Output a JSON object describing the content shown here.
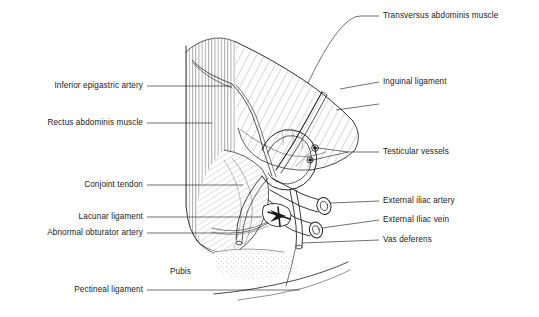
{
  "figure": {
    "background_color": "#ffffff",
    "ink_color": "#1a1a1a",
    "width": 539,
    "height": 317
  },
  "labels_left": [
    {
      "id": "inferior-epigastric-artery",
      "text": "Inferior epigastric artery",
      "x": 143,
      "y": 86,
      "leader_to_x": 232,
      "leader_to_y": 86
    },
    {
      "id": "rectus-abdominis-muscle",
      "text": "Rectus abdominis muscle",
      "x": 143,
      "y": 123,
      "leader_to_x": 212,
      "leader_to_y": 123
    },
    {
      "id": "conjoint-tendon",
      "text": "Conjoint tendon",
      "x": 143,
      "y": 185,
      "leader_to_x": 243,
      "leader_to_y": 185
    },
    {
      "id": "lacunar-ligament",
      "text": "Lacunar ligament",
      "x": 143,
      "y": 217,
      "leader_to_x": 262,
      "leader_to_y": 217
    },
    {
      "id": "abnormal-obturator-artery",
      "text": "Abnormal obturator artery",
      "x": 143,
      "y": 233,
      "leader_to_x": 268,
      "leader_to_y": 222
    },
    {
      "id": "pectineal-ligament",
      "text": "Pectineal ligament",
      "x": 143,
      "y": 290,
      "leader_to_x": 300,
      "leader_to_y": 290
    }
  ],
  "labels_right": [
    {
      "id": "transversus-abdominis-muscle",
      "text": "Transversus abdominis muscle",
      "x": 383,
      "y": 16,
      "leader_to_x": 308,
      "leader_to_y": 83
    },
    {
      "id": "inguinal-ligament",
      "text": "Inguinal ligament",
      "x": 383,
      "y": 82,
      "leader_to_x": 340,
      "leader_to_y": 89
    },
    {
      "id": "testicular-vessels",
      "text": "Testicular vessels",
      "x": 383,
      "y": 152,
      "leader_to_x": 322,
      "leader_to_y": 148
    },
    {
      "id": "external-iliac-artery",
      "text": "External iliac artery",
      "x": 383,
      "y": 201,
      "leader_to_x": 313,
      "leader_to_y": 201
    },
    {
      "id": "external-iliac-vein",
      "text": "External Iliac vein",
      "x": 383,
      "y": 220,
      "leader_to_x": 305,
      "leader_to_y": 220
    },
    {
      "id": "vas-deferens",
      "text": "Vas deferens",
      "x": 383,
      "y": 240,
      "leader_to_x": 300,
      "leader_to_y": 240
    }
  ],
  "labels_free": [
    {
      "id": "pubis",
      "text": "Pubis",
      "x": 170,
      "y": 272
    }
  ],
  "structures": [
    {
      "id": "rectus-abdominis-muscle",
      "hatching": "vertical"
    },
    {
      "id": "transversus-abdominis-muscle",
      "hatching": "diagonal"
    },
    {
      "id": "conjoint-tendon",
      "hatching": "fan"
    },
    {
      "id": "external-iliac-artery",
      "hatching": "tube-cross-section"
    },
    {
      "id": "external-iliac-vein",
      "hatching": "tube-cross-section"
    },
    {
      "id": "vas-deferens",
      "hatching": "tube"
    },
    {
      "id": "testicular-vessels",
      "hatching": "small-circles"
    },
    {
      "id": "inguinal-ligament",
      "hatching": "edge-line"
    },
    {
      "id": "lacunar-ligament",
      "hatching": "solid-dark"
    },
    {
      "id": "pectineal-ligament",
      "hatching": "edge-line"
    },
    {
      "id": "pubis",
      "hatching": "stipple"
    }
  ]
}
